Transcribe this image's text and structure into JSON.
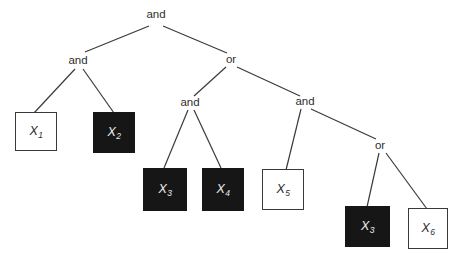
{
  "figure": {
    "colors": {
      "background": "#ffffff",
      "line": "#3a3a3a",
      "box_black_fill": "#161616",
      "box_white_fill": "#ffffff",
      "box_border": "#3a3a3a",
      "text_dark": "#2e2e2e",
      "text_light": "#ececec"
    },
    "gates": [
      {
        "id": "root-and",
        "label": "and",
        "x": 156,
        "y": 15
      },
      {
        "id": "left-and",
        "label": "and",
        "x": 78,
        "y": 61
      },
      {
        "id": "or-1",
        "label": "or",
        "x": 231,
        "y": 60
      },
      {
        "id": "mid-and",
        "label": "and",
        "x": 190,
        "y": 103
      },
      {
        "id": "right-and",
        "label": "and",
        "x": 305,
        "y": 102
      },
      {
        "id": "or-2",
        "label": "or",
        "x": 380,
        "y": 146
      }
    ],
    "leaves": [
      {
        "id": "x1",
        "base": "X",
        "sub": "1",
        "variant": "white",
        "x": 15,
        "y": 112,
        "w": 42,
        "h": 39
      },
      {
        "id": "x2",
        "base": "X",
        "sub": "2",
        "variant": "black",
        "x": 93,
        "y": 112,
        "w": 42,
        "h": 41
      },
      {
        "id": "x3a",
        "base": "X",
        "sub": "3",
        "variant": "black",
        "x": 143,
        "y": 168,
        "w": 44,
        "h": 43
      },
      {
        "id": "x4",
        "base": "X",
        "sub": "4",
        "variant": "black",
        "x": 202,
        "y": 168,
        "w": 42,
        "h": 43
      },
      {
        "id": "x5",
        "base": "X",
        "sub": "5",
        "variant": "white",
        "x": 262,
        "y": 169,
        "w": 42,
        "h": 41
      },
      {
        "id": "x3b",
        "base": "X",
        "sub": "3",
        "variant": "black",
        "x": 345,
        "y": 206,
        "w": 45,
        "h": 41
      },
      {
        "id": "x6",
        "base": "X",
        "sub": "6",
        "variant": "white",
        "x": 408,
        "y": 208,
        "w": 40,
        "h": 41
      }
    ],
    "edges": [
      {
        "from": "root-and",
        "to": "left-and",
        "x1": 149,
        "y1": 26,
        "x2": 85,
        "y2": 52
      },
      {
        "from": "root-and",
        "to": "or-1",
        "x1": 163,
        "y1": 26,
        "x2": 227,
        "y2": 53
      },
      {
        "from": "left-and",
        "to": "x1",
        "x1": 75,
        "y1": 69,
        "x2": 34,
        "y2": 113
      },
      {
        "from": "left-and",
        "to": "x2",
        "x1": 83,
        "y1": 69,
        "x2": 114,
        "y2": 113
      },
      {
        "from": "or-1",
        "to": "mid-and",
        "x1": 226,
        "y1": 67,
        "x2": 194,
        "y2": 96
      },
      {
        "from": "or-1",
        "to": "right-and",
        "x1": 237,
        "y1": 67,
        "x2": 300,
        "y2": 96
      },
      {
        "from": "mid-and",
        "to": "x3a",
        "x1": 188,
        "y1": 110,
        "x2": 164,
        "y2": 168
      },
      {
        "from": "mid-and",
        "to": "x4",
        "x1": 194,
        "y1": 110,
        "x2": 221,
        "y2": 168
      },
      {
        "from": "right-and",
        "to": "x5",
        "x1": 301,
        "y1": 109,
        "x2": 286,
        "y2": 170
      },
      {
        "from": "right-and",
        "to": "or-2",
        "x1": 311,
        "y1": 109,
        "x2": 376,
        "y2": 139
      },
      {
        "from": "or-2",
        "to": "x3b",
        "x1": 379,
        "y1": 153,
        "x2": 367,
        "y2": 207
      },
      {
        "from": "or-2",
        "to": "x6",
        "x1": 386,
        "y1": 153,
        "x2": 427,
        "y2": 209
      }
    ]
  }
}
